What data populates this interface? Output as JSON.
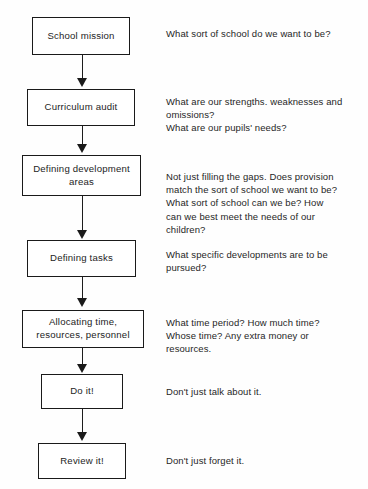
{
  "diagram": {
    "background_color": "#fefefe",
    "line_color": "#1a1a1a",
    "text_color": "#242424"
  },
  "steps": [
    {
      "id": "school-mission",
      "box_label": "School mission",
      "note": "What sort of school do we want to be?"
    },
    {
      "id": "curriculum-audit",
      "box_label": "Curriculum audit",
      "note": "What are our strengths. weaknesses and\nomissions?\nWhat are our pupils' needs?"
    },
    {
      "id": "defining-development-areas",
      "box_label": "Defining development\nareas",
      "note": "Not just filling the gaps. Does provision\nmatch the sort of school we want to be?\nWhat sort of school can we be? How\ncan we best meet the needs of our\nchildren?"
    },
    {
      "id": "defining-tasks",
      "box_label": "Defining tasks",
      "note": "What specific developments are to be\npursued?"
    },
    {
      "id": "allocating-resources",
      "box_label": "Allocating time,\nresources, personnel",
      "note": "What time period? How much time?\nWhose time? Any extra money or\nresources."
    },
    {
      "id": "do-it",
      "box_label": "Do it!",
      "note": "Don't just talk about it."
    },
    {
      "id": "review-it",
      "box_label": "Review it!",
      "note": "Don't just forget it."
    }
  ]
}
